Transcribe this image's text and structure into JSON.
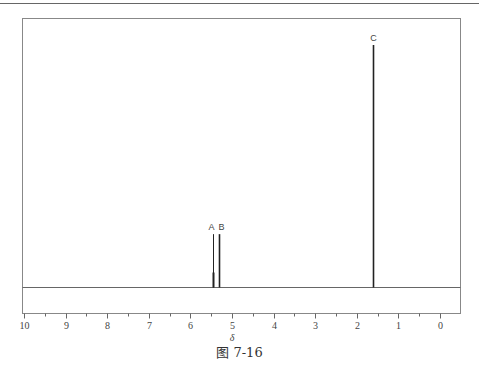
{
  "chart_data": {
    "type": "line",
    "title": "",
    "caption": "图 7-16",
    "xlabel": "δ",
    "ylabel": "",
    "xlim": [
      10,
      0
    ],
    "x_reversed": true,
    "grid": false,
    "ticks": [
      "10",
      "9",
      "8",
      "7",
      "6",
      "5",
      "4",
      "3",
      "2",
      "1",
      "0"
    ],
    "minor_ticks_every": 0.5,
    "peaks": [
      {
        "label": "A",
        "delta": 5.46,
        "relative_height": 0.22
      },
      {
        "label": "B",
        "delta": 5.31,
        "relative_height": 0.22
      },
      {
        "label": "C",
        "delta": 1.61,
        "relative_height": 1.0
      }
    ]
  },
  "figure": {
    "caption": "图 7-16",
    "xlabel": "δ"
  }
}
